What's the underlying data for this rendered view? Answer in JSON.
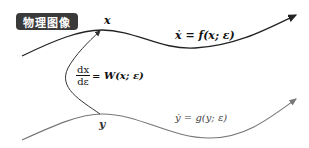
{
  "badge": {
    "label": "物理图像"
  },
  "labels": {
    "x": "x",
    "y": "y"
  },
  "equations": {
    "f": "ẋ = f(x; ε)",
    "g": "ẏ = g(y; ε)",
    "w": {
      "numerator": "dx",
      "denominator": "dε",
      "rhs": "= W(x; ε)"
    }
  },
  "colors": {
    "badge_bg": "#3a3a3a",
    "upper_curve": "#222222",
    "lower_curve": "#777777",
    "connector": "#333333"
  }
}
